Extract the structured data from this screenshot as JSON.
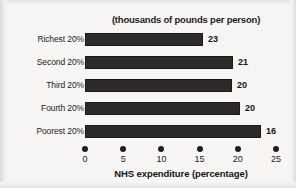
{
  "chart_data": {
    "type": "bar",
    "orientation": "horizontal",
    "title": "(thousands of pounds per person)",
    "xlabel": "NHS expenditure (percentage)",
    "ylabel": "",
    "xlim": [
      0,
      25
    ],
    "xticks": [
      0,
      5,
      10,
      15,
      20,
      25
    ],
    "xticklabels": [
      "0",
      "5",
      "10",
      "15",
      "20",
      "25"
    ],
    "grid": false,
    "legend": false,
    "categories": [
      "Richest 20%",
      "Second 20%",
      "Third 20%",
      "Fourth 20%",
      "Poorest 20%"
    ],
    "values": [
      15.4,
      19.4,
      19.2,
      20.3,
      23.0
    ],
    "bar_labels": [
      "23",
      "21",
      "20",
      "20",
      "16"
    ],
    "bar_label_meaning": "thousands of pounds per person",
    "series": [
      {
        "name": "NHS expenditure (percentage)",
        "values": [
          15.4,
          19.4,
          19.2,
          20.3,
          23.0
        ]
      },
      {
        "name": "thousands of pounds per person",
        "values": [
          23,
          21,
          20,
          20,
          16
        ]
      }
    ],
    "colors": {
      "bar": "#2b2b2b",
      "bar_border": "#1a1a1a",
      "text": "#1b1b1b",
      "background": "#f6f5f3"
    }
  },
  "figure": {
    "title": "(thousands of pounds per person)",
    "axis_label": "NHS expenditure (percentage)",
    "rows": [
      {
        "label": "Richest 20%",
        "value": 15.4,
        "display": "23"
      },
      {
        "label": "Second 20%",
        "value": 19.4,
        "display": "21"
      },
      {
        "label": "Third 20%",
        "value": 19.2,
        "display": "20"
      },
      {
        "label": "Fourth 20%",
        "value": 20.3,
        "display": "20"
      },
      {
        "label": "Poorest 20%",
        "value": 23.0,
        "display": "16"
      }
    ],
    "ticks": [
      {
        "value": 0,
        "label": "0"
      },
      {
        "value": 5,
        "label": "5"
      },
      {
        "value": 10,
        "label": "10"
      },
      {
        "value": 15,
        "label": "15"
      },
      {
        "value": 20,
        "label": "20"
      },
      {
        "value": 25,
        "label": "25"
      }
    ]
  }
}
